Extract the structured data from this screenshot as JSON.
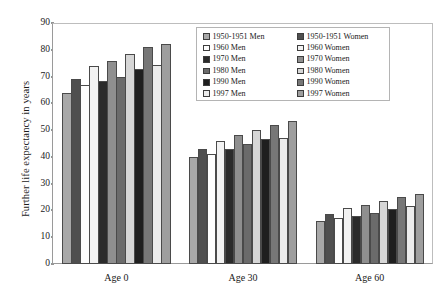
{
  "chart_data": {
    "type": "bar",
    "title": "",
    "xlabel": "",
    "ylabel": "Further life expectancy in years",
    "ylim": [
      0,
      90
    ],
    "ytick_step": 10,
    "yticks": [
      0,
      10,
      20,
      30,
      40,
      50,
      60,
      70,
      80,
      90
    ],
    "grid": false,
    "legend_position": "inside-top-center",
    "categories": [
      "Age 0",
      "Age 30",
      "Age 60"
    ],
    "series": [
      {
        "name": "1950-1951 Men",
        "color": "#a8a8a8",
        "values": [
          64.0,
          40.0,
          16.0
        ]
      },
      {
        "name": "1950-1951 Women",
        "color": "#4f4f4f",
        "values": [
          69.0,
          43.0,
          18.5
        ]
      },
      {
        "name": "1960 Men",
        "color": "#fdfdfd",
        "values": [
          67.0,
          41.0,
          17.0
        ]
      },
      {
        "name": "1960 Women",
        "color": "#f2f2f2",
        "values": [
          74.0,
          46.0,
          21.0
        ]
      },
      {
        "name": "1970 Men",
        "color": "#2b2b2b",
        "values": [
          68.5,
          43.0,
          18.0
        ]
      },
      {
        "name": "1970 Women",
        "color": "#8f8f8f",
        "values": [
          76.0,
          48.0,
          22.0
        ]
      },
      {
        "name": "1980 Men",
        "color": "#6b6b6b",
        "values": [
          70.0,
          45.0,
          19.0
        ]
      },
      {
        "name": "1980 Women",
        "color": "#d6d6d6",
        "values": [
          78.5,
          50.0,
          23.5
        ]
      },
      {
        "name": "1990 Men",
        "color": "#1f1f1f",
        "values": [
          73.0,
          46.5,
          20.5
        ]
      },
      {
        "name": "1990 Women",
        "color": "#777777",
        "values": [
          81.0,
          52.0,
          25.0
        ]
      },
      {
        "name": "1997 Men",
        "color": "#ececec",
        "values": [
          74.5,
          47.0,
          21.5
        ]
      },
      {
        "name": "1997 Women",
        "color": "#9e9e9e",
        "values": [
          82.0,
          53.5,
          26.0
        ]
      }
    ]
  },
  "legend": {
    "columns": [
      {
        "entries": [
          {
            "label": "1950-1951 Men",
            "color": "#a8a8a8"
          },
          {
            "label": "1960 Men",
            "color": "#fdfdfd"
          },
          {
            "label": "1970 Men",
            "color": "#2b2b2b"
          },
          {
            "label": "1980 Men",
            "color": "#6b6b6b"
          },
          {
            "label": "1990 Men",
            "color": "#1f1f1f"
          },
          {
            "label": "1997 Men",
            "color": "#ececec"
          }
        ]
      },
      {
        "entries": [
          {
            "label": "1950-1951 Women",
            "color": "#4f4f4f"
          },
          {
            "label": "1960 Women",
            "color": "#f2f2f2"
          },
          {
            "label": "1970 Women",
            "color": "#8f8f8f"
          },
          {
            "label": "1980 Women",
            "color": "#d6d6d6"
          },
          {
            "label": "1990 Women",
            "color": "#777777"
          },
          {
            "label": "1997 Women",
            "color": "#9e9e9e"
          }
        ]
      }
    ]
  },
  "axis": {
    "y_title": "Further life expectancy in years"
  }
}
